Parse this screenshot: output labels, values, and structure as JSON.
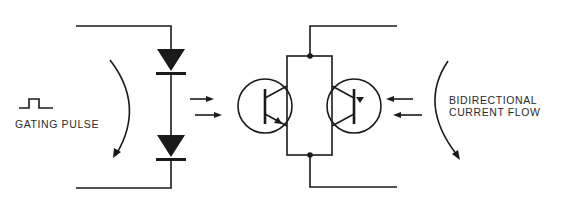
{
  "diagram": {
    "type": "circuit-schematic",
    "left_label": "GATING PULSE",
    "right_label_line1": "BIDIRECTIONAL",
    "right_label_line2": "CURRENT FLOW",
    "components": [
      {
        "kind": "pulse-waveform-symbol"
      },
      {
        "kind": "diode",
        "index": 1
      },
      {
        "kind": "diode",
        "index": 2
      },
      {
        "kind": "transistor",
        "index": 1
      },
      {
        "kind": "transistor",
        "index": 2
      }
    ],
    "stroke_color": "#1a1a1a",
    "background": "#ffffff"
  }
}
